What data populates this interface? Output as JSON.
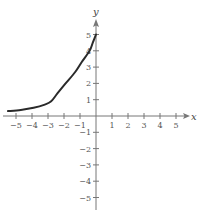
{
  "chart_data": {
    "type": "line",
    "title": "",
    "xlabel": "x",
    "ylabel": "y",
    "xlim": [
      -5.5,
      5.5
    ],
    "ylim": [
      -5.5,
      5.5
    ],
    "grid": false,
    "legend": null,
    "x_ticks": [
      -5,
      -4,
      -3,
      -2,
      -1,
      1,
      2,
      3,
      4,
      5
    ],
    "y_ticks": [
      -5,
      -4,
      -3,
      -2,
      -1,
      1,
      2,
      3,
      4,
      5
    ],
    "x_tick_labels": [
      "−5",
      "−4",
      "−3",
      "−2",
      "−1",
      "1",
      "2",
      "3",
      "4",
      "5"
    ],
    "y_tick_labels": [
      "−5",
      "−4",
      "−3",
      "−2",
      "−1",
      "1",
      "2",
      "3",
      "4",
      "5"
    ],
    "series": [
      {
        "name": "curve",
        "color": "#2a2a2a",
        "x": [
          -5.5,
          -4.7,
          -3.9,
          -3.2,
          -2.8,
          -2.4,
          -1.9,
          -1.3,
          -0.9,
          -0.4,
          -0.2,
          0
        ],
        "y": [
          0.3,
          0.37,
          0.5,
          0.7,
          0.9,
          1.4,
          2.0,
          2.7,
          3.3,
          4.0,
          4.5,
          5.0
        ]
      }
    ]
  },
  "layout": {
    "origin_px": [
      96,
      116
    ],
    "unit_px_x": 16.0,
    "unit_px_y": 16.3,
    "axis_color": "#777777"
  }
}
